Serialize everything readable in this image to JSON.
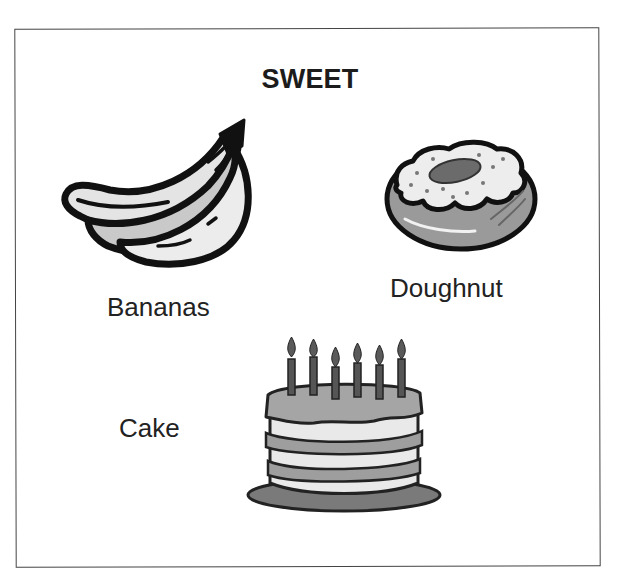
{
  "card": {
    "title": "SWEET",
    "items": [
      {
        "label": "Bananas",
        "icon": "banana-icon"
      },
      {
        "label": "Doughnut",
        "icon": "doughnut-icon"
      },
      {
        "label": "Cake",
        "icon": "birthday-cake-icon"
      }
    ]
  },
  "colors": {
    "ink": "#1a1a1a",
    "border": "#444444",
    "light_fill": "#e6e6e6",
    "mid_fill": "#a8a8a8",
    "dark_fill": "#6e6e6e"
  },
  "cake": {
    "candle_count": 6
  }
}
